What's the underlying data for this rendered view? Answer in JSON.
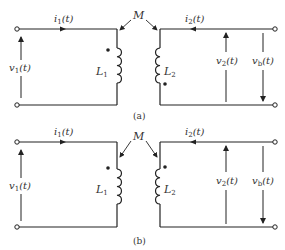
{
  "figure": {
    "type": "coupled-inductor circuits",
    "mutual_label": "M",
    "panels": [
      {
        "caption": "(a)",
        "left": {
          "current": "i",
          "current_sub": "1",
          "current_arg": "(t)",
          "voltage": "v",
          "voltage_sub": "1",
          "voltage_arg": "(t)",
          "inductor": "L",
          "inductor_sub": "1",
          "dot": "top"
        },
        "right": {
          "current": "i",
          "current_sub": "2",
          "current_arg": "(t)",
          "voltage2": "v",
          "voltage2_sub": "2",
          "voltage2_arg": "(t)",
          "voltageb": "v",
          "voltageb_sub": "b",
          "voltageb_arg": "(t)",
          "inductor": "L",
          "inductor_sub": "2",
          "dot": "bottom"
        }
      },
      {
        "caption": "(b)",
        "left": {
          "current": "i",
          "current_sub": "1",
          "current_arg": "(t)",
          "voltage": "v",
          "voltage_sub": "1",
          "voltage_arg": "(t)",
          "inductor": "L",
          "inductor_sub": "1",
          "dot": "top"
        },
        "right": {
          "current": "i",
          "current_sub": "2",
          "current_arg": "(t)",
          "voltage2": "v",
          "voltage2_sub": "2",
          "voltage2_arg": "(t)",
          "voltageb": "v",
          "voltageb_sub": "b",
          "voltageb_arg": "(t)",
          "inductor": "L",
          "inductor_sub": "2",
          "dot": "top"
        }
      }
    ],
    "colors": {
      "ink": "#222222",
      "background": "#ffffff"
    }
  }
}
